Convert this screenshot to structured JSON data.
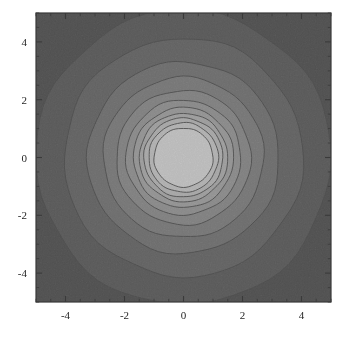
{
  "figure": {
    "title": "",
    "background_color": "#ffffff",
    "frame_color": "#3a3a3a",
    "width": 347,
    "height": 337
  },
  "axes": {
    "x": {
      "label": "",
      "range": [
        -5,
        5
      ],
      "major_ticks": [
        -4,
        -2,
        0,
        2,
        4
      ],
      "major_tick_labels": [
        "-4",
        "-2",
        "0",
        "2",
        "4"
      ],
      "minor_tick_step": 0.5,
      "tick_side": "inward"
    },
    "y": {
      "label": "",
      "range": [
        -5,
        5
      ],
      "major_ticks": [
        -4,
        -2,
        0,
        2,
        4
      ],
      "major_tick_labels": [
        "-4",
        "-2",
        "0",
        "2",
        "4"
      ],
      "minor_tick_step": 0.5,
      "tick_side": "inward"
    }
  },
  "chart_data": {
    "type": "heatmap",
    "subtype": "filled-contour",
    "title": "",
    "xlabel": "",
    "ylabel": "",
    "xlim": [
      -5,
      5
    ],
    "ylim": [
      -5,
      5
    ],
    "grid": false,
    "legend": "none",
    "symmetry": "radial",
    "center": [
      0,
      0
    ],
    "colormap": "GrayLevels",
    "contour_outline_color": "#111111",
    "contour_outline_width": 0.9,
    "bands": [
      {
        "index": 0,
        "r_inner": 0.0,
        "r_outer": 1.0,
        "color": "#ffffff",
        "level_label": ""
      },
      {
        "index": 1,
        "r_inner": 1.0,
        "r_outer": 1.18,
        "color": "#e6e6e6",
        "level_label": ""
      },
      {
        "index": 2,
        "r_inner": 1.18,
        "r_outer": 1.34,
        "color": "#d2d2d2",
        "level_label": ""
      },
      {
        "index": 3,
        "r_inner": 1.34,
        "r_outer": 1.5,
        "color": "#bdbdbd",
        "level_label": ""
      },
      {
        "index": 4,
        "r_inner": 1.5,
        "r_outer": 1.7,
        "color": "#a8a8a8",
        "level_label": ""
      },
      {
        "index": 5,
        "r_inner": 1.7,
        "r_outer": 1.95,
        "color": "#949494",
        "level_label": ""
      },
      {
        "index": 6,
        "r_inner": 1.95,
        "r_outer": 2.28,
        "color": "#808080",
        "level_label": ""
      },
      {
        "index": 7,
        "r_inner": 2.28,
        "r_outer": 2.72,
        "color": "#6b6b6b",
        "level_label": ""
      },
      {
        "index": 8,
        "r_inner": 2.72,
        "r_outer": 3.25,
        "color": "#575757",
        "level_label": ""
      },
      {
        "index": 9,
        "r_inner": 3.25,
        "r_outer": 4.05,
        "color": "#3f3f3f",
        "level_label": ""
      },
      {
        "index": 10,
        "r_inner": 4.05,
        "r_outer": 5.0,
        "color": "#2b2b2b",
        "level_label": ""
      },
      {
        "index": 11,
        "r_inner": 5.0,
        "r_outer": 8.0,
        "color": "#171717",
        "level_label": ""
      }
    ]
  }
}
